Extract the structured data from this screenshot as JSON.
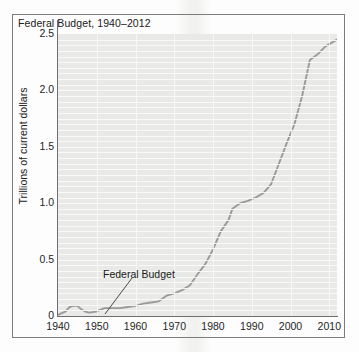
{
  "figure": {
    "title": "Federal Budget, 1940–2012",
    "ylabel": "Trillions of current dollars",
    "annotation_label": "Federal Budget"
  },
  "colors": {
    "plot_background": "#e9e9e7",
    "gridline": "#fafafa",
    "series_line": "#9a9a9a",
    "axis": "#6f6f6f",
    "frame": "#7c7c7c",
    "text": "#1f1f1f"
  },
  "axes": {
    "y_ticks": [
      "0",
      "0.5",
      "1.0",
      "1.5",
      "2.0",
      "2.5"
    ],
    "y_tick_values": [
      0,
      0.5,
      1.0,
      1.5,
      2.0,
      2.5
    ],
    "x_ticks": [
      "1940",
      "1950",
      "1960",
      "1970",
      "1980",
      "1990",
      "2000",
      "2010"
    ],
    "x_tick_values": [
      1940,
      1950,
      1960,
      1970,
      1980,
      1990,
      2000,
      2010
    ]
  },
  "chart_data": {
    "type": "line",
    "title": "Federal Budget, 1940–2012",
    "xlabel": "",
    "ylabel": "Trillions of current dollars",
    "xlim": [
      1940,
      2012
    ],
    "ylim": [
      0,
      2.5
    ],
    "grid": true,
    "legend": "none",
    "annotations": [
      {
        "text": "Federal Budget",
        "x": 1962,
        "y": 0.1,
        "label_x": 1965,
        "label_y": 0.42
      }
    ],
    "series": [
      {
        "name": "Federal Budget",
        "color": "#9a9a9a",
        "x": [
          1940,
          1942,
          1943,
          1944,
          1945,
          1946,
          1947,
          1948,
          1950,
          1952,
          1954,
          1956,
          1958,
          1960,
          1962,
          1964,
          1966,
          1968,
          1970,
          1972,
          1974,
          1976,
          1978,
          1980,
          1982,
          1984,
          1985,
          1987,
          1989,
          1991,
          1993,
          1995,
          1997,
          1999,
          2001,
          2003,
          2005,
          2007,
          2009,
          2012
        ],
        "y": [
          0.01,
          0.04,
          0.08,
          0.09,
          0.09,
          0.06,
          0.04,
          0.03,
          0.04,
          0.07,
          0.07,
          0.07,
          0.08,
          0.09,
          0.11,
          0.12,
          0.13,
          0.18,
          0.2,
          0.23,
          0.27,
          0.37,
          0.46,
          0.59,
          0.75,
          0.85,
          0.95,
          1.0,
          1.02,
          1.05,
          1.09,
          1.17,
          1.35,
          1.53,
          1.7,
          1.95,
          2.27,
          2.32,
          2.39,
          2.45
        ]
      }
    ]
  }
}
